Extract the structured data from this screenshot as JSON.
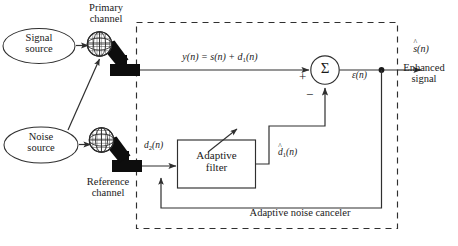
{
  "figure": {
    "background": "#ffffff",
    "stroke": "#3a3a3a",
    "fill_black": "#0d0d0d"
  },
  "sources": {
    "signal": {
      "line1": "Signal",
      "line2": "source"
    },
    "noise": {
      "line1": "Noise",
      "line2": "source"
    }
  },
  "channels": {
    "primary": {
      "line1": "Primary",
      "line2": "channel"
    },
    "reference": {
      "line1": "Reference",
      "line2": "channel"
    }
  },
  "signals": {
    "primary_equation": {
      "y": "y",
      "paren_n1": "(n)",
      "equals": "=",
      "s": "s",
      "paren_n2": "(n)",
      "plus": "+",
      "d": "d",
      "sub1": "1",
      "paren_n3": "(n)"
    },
    "primary_equation_text": "y(n) = s(n) + d1(n)",
    "reference_input": "d2(n)",
    "reference_input_parts": {
      "d": "d",
      "sub": "2",
      "paren": "(n)"
    },
    "filter_output": "d̂1(n)",
    "filter_output_parts": {
      "hat": "^",
      "d": "d",
      "sub": "1",
      "paren": "(n)"
    },
    "error": "ε(n)",
    "error_parts": {
      "eps": "ε",
      "paren": "(n)"
    },
    "enhanced": "ŝ(n)",
    "enhanced_parts": {
      "hat": "^",
      "s": "s",
      "paren": "(n)"
    }
  },
  "adder": {
    "symbol": "Σ",
    "plus_sign": "+",
    "minus_sign": "−"
  },
  "filter_block": {
    "line1": "Adaptive",
    "line2": "filter"
  },
  "outputs": {
    "enhanced_caption_line1": "Enhanced",
    "enhanced_caption_line2": "signal"
  },
  "enclosure": {
    "caption": "Adaptive noise canceler"
  }
}
